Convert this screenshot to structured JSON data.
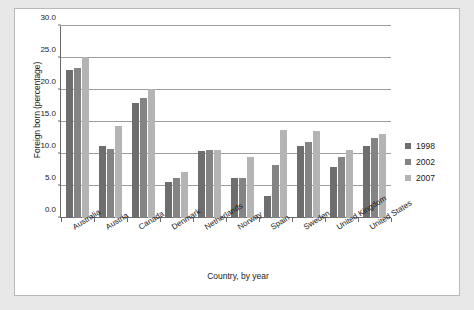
{
  "chart_data": {
    "type": "bar",
    "title": "",
    "xlabel": "Country, by year",
    "ylabel": "Foreign born (percentage)",
    "ylim": [
      0.0,
      30.0
    ],
    "ytick_step": 5.0,
    "ytick_labels": [
      "0.0",
      "5.0",
      "10.0",
      "15.0",
      "20.0",
      "25.0",
      "30.0"
    ],
    "ytick_values": [
      0.0,
      5.0,
      10.0,
      15.0,
      20.0,
      25.0,
      30.0
    ],
    "grid": "horizontal",
    "legend_position": "right",
    "categories": [
      "Australia",
      "Austria",
      "Canada",
      "Denmark",
      "Netherlands",
      "Norway",
      "Spain",
      "Sweden",
      "United Kingdom",
      "United States"
    ],
    "series": [
      {
        "name": "1998",
        "color": "#6e6e6e",
        "values": [
          23.1,
          11.3,
          17.9,
          5.6,
          10.4,
          6.2,
          3.4,
          11.3,
          8.0,
          11.2
        ]
      },
      {
        "name": "2002",
        "color": "#848484",
        "values": [
          23.4,
          10.8,
          18.8,
          6.2,
          10.6,
          6.3,
          8.3,
          11.9,
          9.5,
          12.5
        ]
      },
      {
        "name": "2007",
        "color": "#b4b4b4",
        "values": [
          25.2,
          14.3,
          20.1,
          7.2,
          10.7,
          9.5,
          13.7,
          13.6,
          10.6,
          13.1
        ]
      }
    ]
  }
}
